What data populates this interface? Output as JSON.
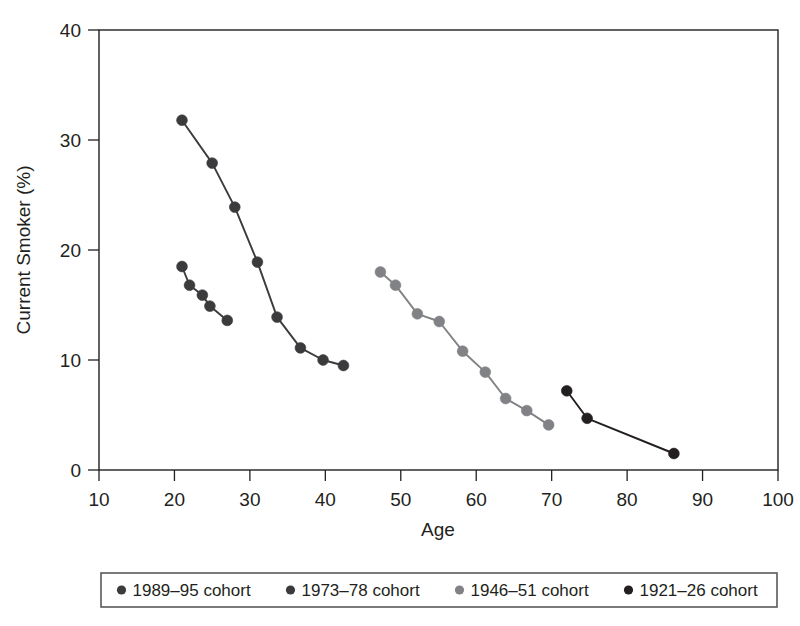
{
  "chart_data": {
    "type": "line",
    "title": "",
    "xlabel": "Age",
    "ylabel": "Current Smoker (%)",
    "xlim": [
      10,
      100
    ],
    "ylim": [
      0,
      40
    ],
    "xticks": [
      10,
      20,
      30,
      40,
      50,
      60,
      70,
      80,
      90,
      100
    ],
    "yticks": [
      0,
      10,
      20,
      30,
      40
    ],
    "grid": false,
    "legend_position": "below-outside",
    "marker": "circle",
    "series": [
      {
        "name": "1989–95 cohort",
        "color": "#3b3b3d",
        "x": [
          21.0,
          22.0,
          23.7,
          24.7,
          27.0
        ],
        "y": [
          18.5,
          16.8,
          15.9,
          14.9,
          13.6
        ]
      },
      {
        "name": "1973–78 cohort",
        "color": "#3b3b3d",
        "x": [
          21.0,
          25.0,
          28.0,
          31.0,
          33.6,
          36.7,
          39.7,
          42.4
        ],
        "y": [
          31.8,
          27.9,
          23.9,
          18.9,
          13.9,
          11.1,
          10.0,
          9.5
        ]
      },
      {
        "name": "1946–51 cohort",
        "color": "#808285",
        "x": [
          47.3,
          49.3,
          52.2,
          55.1,
          58.2,
          61.2,
          63.9,
          66.7,
          69.6
        ],
        "y": [
          18.0,
          16.8,
          14.2,
          13.5,
          10.8,
          8.9,
          6.5,
          5.4,
          4.1
        ]
      },
      {
        "name": "1921–26 cohort",
        "color": "#231f20",
        "x": [
          72.0,
          74.7,
          86.2
        ],
        "y": [
          7.2,
          4.7,
          1.5
        ]
      }
    ]
  },
  "legend": {
    "items": [
      {
        "label": "1989–95 cohort",
        "color": "#3b3b3d"
      },
      {
        "label": "1973–78 cohort",
        "color": "#3b3b3d"
      },
      {
        "label": "1946–51 cohort",
        "color": "#808285"
      },
      {
        "label": "1921–26 cohort",
        "color": "#231f20"
      }
    ]
  },
  "axes": {
    "x": {
      "title": "Age",
      "tick_labels": [
        "10",
        "20",
        "30",
        "40",
        "50",
        "60",
        "70",
        "80",
        "90",
        "100"
      ]
    },
    "y": {
      "title": "Current Smoker (%)",
      "tick_labels": [
        "0",
        "10",
        "20",
        "30",
        "40"
      ]
    }
  }
}
